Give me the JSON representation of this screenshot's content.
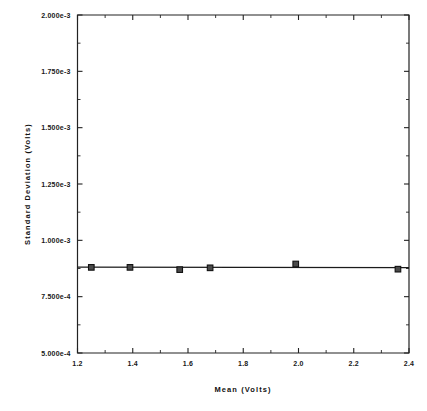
{
  "chart_data": {
    "type": "scatter",
    "title": "",
    "xlabel": "Mean   (Volts)",
    "ylabel": "Standard   Deviation   (Volts)",
    "xlim": [
      1.2,
      2.4
    ],
    "ylim": [
      0.0005,
      0.002
    ],
    "grid": false,
    "legend": null,
    "x_ticks": [
      1.2,
      1.4,
      1.6,
      1.8,
      2.0,
      2.2,
      2.4
    ],
    "x_tick_labels": [
      "1.2",
      "1.4",
      "1.6",
      "1.8",
      "2.0",
      "2.2",
      "2.4"
    ],
    "x_minor_ticks": [
      1.3,
      1.5,
      1.7,
      1.9,
      2.1,
      2.3
    ],
    "y_ticks": [
      0.0005,
      0.00075,
      0.001,
      0.00125,
      0.0015,
      0.00175,
      0.002
    ],
    "y_tick_labels": [
      "5.000e-4",
      "7.500e-4",
      "1.000e-3",
      "1.250e-3",
      "1.500e-3",
      "1.750e-3",
      "2.000e-3"
    ],
    "y_minor_ticks": [
      0.000625,
      0.000875,
      0.001125,
      0.001375,
      0.001625,
      0.001875
    ],
    "series": [
      {
        "name": "Standard Deviation vs Mean",
        "marker": "square",
        "x": [
          1.25,
          1.39,
          1.57,
          1.68,
          1.99,
          2.36
        ],
        "y": [
          0.00088,
          0.00088,
          0.00087,
          0.000878,
          0.000895,
          0.000872
        ]
      }
    ],
    "fit_line": {
      "name": "trend-line",
      "x": [
        1.2,
        2.4
      ],
      "y": [
        0.000881,
        0.000879
      ]
    },
    "colors": {
      "axis": "#222222",
      "line": "#1b1b1b",
      "marker_fill": "#4a4a4a",
      "marker_edge": "#111111",
      "background": "#ffffff"
    }
  }
}
